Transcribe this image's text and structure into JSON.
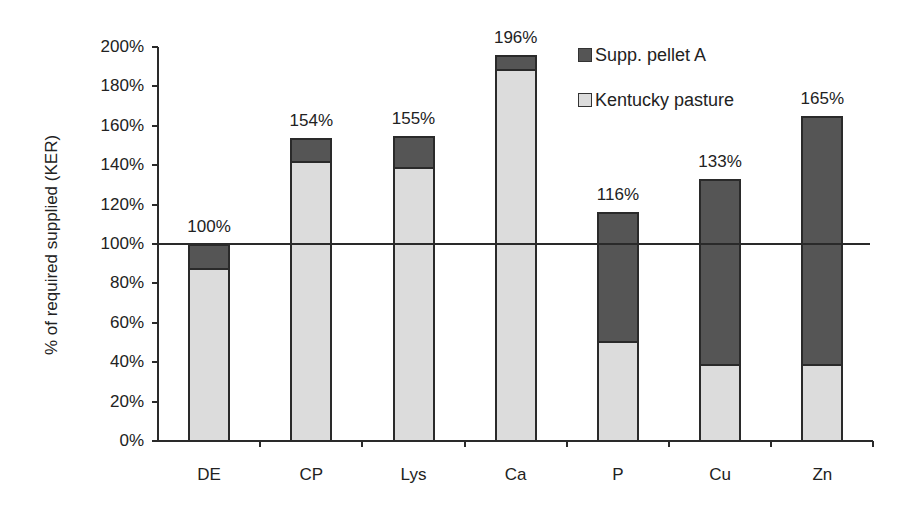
{
  "chart_data": {
    "type": "bar",
    "stacked": true,
    "title": "",
    "xlabel": "",
    "ylabel": "% of required supplied (KER)",
    "ylim": [
      0,
      200
    ],
    "yticks": [
      "0%",
      "20%",
      "40%",
      "60%",
      "80%",
      "100%",
      "120%",
      "140%",
      "160%",
      "180%",
      "200%"
    ],
    "categories": [
      "DE",
      "CP",
      "Lys",
      "Ca",
      "P",
      "Cu",
      "Zn"
    ],
    "series": [
      {
        "name": "Kentucky pasture",
        "color": "#dcdcdc",
        "values": [
          88,
          142,
          139,
          189,
          51,
          39,
          39
        ]
      },
      {
        "name": "Supp. pellet A",
        "color": "#555555",
        "values": [
          12,
          12,
          16,
          7,
          65,
          94,
          126
        ]
      }
    ],
    "totals": [
      100,
      154,
      155,
      196,
      116,
      133,
      165
    ],
    "total_labels": [
      "100%",
      "154%",
      "155%",
      "196%",
      "116%",
      "133%",
      "165%"
    ],
    "reference_line": {
      "value": 100,
      "label": "100% requirement"
    },
    "legend": {
      "position": "top-right",
      "entries": [
        "Supp. pellet A",
        "Kentucky pasture"
      ]
    },
    "grid": false
  }
}
